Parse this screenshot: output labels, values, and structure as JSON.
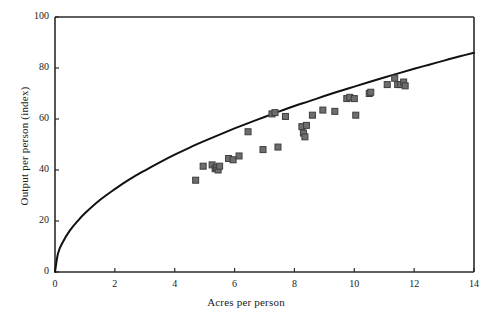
{
  "chart_data": {
    "type": "scatter",
    "title": "",
    "xlabel": "Acres per person",
    "ylabel": "Output per person (index)",
    "xlim": [
      0,
      14
    ],
    "ylim": [
      0,
      100
    ],
    "xticks": [
      0,
      2,
      4,
      6,
      8,
      10,
      12,
      14
    ],
    "yticks": [
      0,
      20,
      40,
      60,
      80,
      100
    ],
    "grid": false,
    "legend": null,
    "marker_color": "#6e6e6e",
    "marker_edge_color": "#3d3d3d",
    "curve_color": "#111111",
    "axis_color": "#2b2b2b",
    "series": [
      {
        "name": "observations",
        "type": "scatter",
        "points": [
          [
            4.7,
            36.0
          ],
          [
            4.95,
            41.5
          ],
          [
            5.25,
            42.0
          ],
          [
            5.35,
            40.5
          ],
          [
            5.4,
            41.0
          ],
          [
            5.45,
            40.0
          ],
          [
            5.5,
            41.5
          ],
          [
            5.8,
            44.5
          ],
          [
            5.95,
            44.0
          ],
          [
            6.15,
            45.5
          ],
          [
            6.45,
            55.0
          ],
          [
            6.95,
            48.0
          ],
          [
            7.25,
            62.0
          ],
          [
            7.35,
            62.5
          ],
          [
            7.45,
            49.0
          ],
          [
            7.7,
            61.0
          ],
          [
            8.25,
            57.0
          ],
          [
            8.3,
            54.5
          ],
          [
            8.35,
            53.0
          ],
          [
            8.4,
            57.5
          ],
          [
            8.6,
            61.5
          ],
          [
            8.95,
            63.5
          ],
          [
            9.35,
            63.0
          ],
          [
            9.75,
            68.0
          ],
          [
            9.85,
            68.5
          ],
          [
            10.0,
            68.0
          ],
          [
            10.05,
            61.5
          ],
          [
            10.5,
            70.0
          ],
          [
            10.55,
            70.5
          ],
          [
            11.1,
            73.5
          ],
          [
            11.35,
            76.0
          ],
          [
            11.45,
            73.5
          ],
          [
            11.55,
            73.5
          ],
          [
            11.65,
            74.5
          ],
          [
            11.7,
            73.0
          ]
        ]
      },
      {
        "name": "fitted-curve",
        "type": "line",
        "description": "concave fitted power curve through origin",
        "points": [
          [
            0.0,
            0.0
          ],
          [
            0.1,
            7.3
          ],
          [
            0.25,
            11.5
          ],
          [
            0.5,
            16.3
          ],
          [
            0.75,
            19.9
          ],
          [
            1.0,
            23.0
          ],
          [
            1.5,
            28.2
          ],
          [
            2.0,
            32.5
          ],
          [
            2.5,
            36.4
          ],
          [
            3.0,
            39.8
          ],
          [
            3.5,
            43.0
          ],
          [
            4.0,
            46.0
          ],
          [
            4.5,
            48.8
          ],
          [
            5.0,
            51.4
          ],
          [
            5.5,
            53.9
          ],
          [
            6.0,
            56.3
          ],
          [
            6.5,
            58.6
          ],
          [
            7.0,
            60.8
          ],
          [
            7.5,
            63.0
          ],
          [
            8.0,
            65.1
          ],
          [
            8.5,
            67.0
          ],
          [
            9.0,
            69.0
          ],
          [
            9.5,
            70.9
          ],
          [
            10.0,
            72.7
          ],
          [
            10.5,
            74.5
          ],
          [
            11.0,
            76.3
          ],
          [
            11.5,
            78.0
          ],
          [
            12.0,
            79.7
          ],
          [
            12.5,
            81.3
          ],
          [
            13.0,
            82.9
          ],
          [
            13.5,
            84.5
          ],
          [
            14.0,
            86.0
          ]
        ]
      }
    ]
  }
}
